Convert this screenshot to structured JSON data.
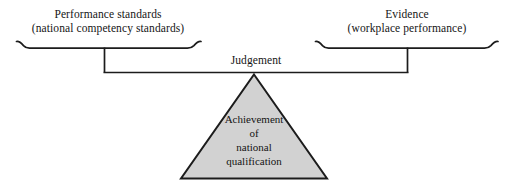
{
  "diagram": {
    "colors": {
      "line": "#1c1c1c",
      "triangle_fill": "#d2d2d2",
      "background": "#ffffff",
      "text": "#151515"
    },
    "left_label": {
      "line1": "Performance standards",
      "line2": "(national competency standards)"
    },
    "right_label": {
      "line1": "Evidence",
      "line2": "(workplace performance)"
    },
    "beam_label": "Judgement",
    "fulcrum": {
      "line1": "Achievement",
      "line2": "of",
      "line3": "national",
      "line4": "qualification"
    }
  }
}
